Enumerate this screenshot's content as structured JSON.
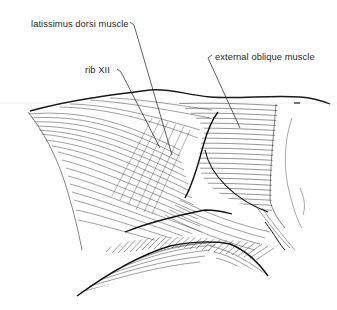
{
  "diagram": {
    "labels": [
      {
        "id": "latissimus",
        "text": "latissimus dorsi muscle",
        "x": 31,
        "y": 18
      },
      {
        "id": "rib12",
        "text": "rib XII",
        "x": 85,
        "y": 64
      },
      {
        "id": "ext_oblique",
        "text": "external oblique muscle",
        "x": 215,
        "y": 51
      }
    ],
    "leaders": [
      {
        "for": "latissimus",
        "from": [
          133,
          24
        ],
        "to": [
          172,
          155
        ]
      },
      {
        "for": "rib12",
        "from": [
          120,
          71
        ],
        "to": [
          160,
          148
        ]
      },
      {
        "for": "ext_oblique",
        "from": [
          208,
          58
        ],
        "to": [
          240,
          128
        ]
      }
    ],
    "colors": {
      "ink": "#1a1a1a",
      "label": "#2a2a2a",
      "background": "#ffffff"
    }
  }
}
